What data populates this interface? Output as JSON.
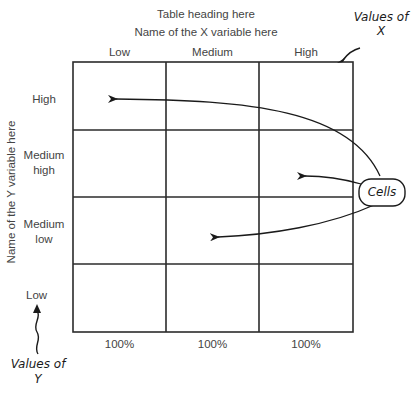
{
  "table": {
    "heading": "Table heading here",
    "x_variable_name": "Name of the X variable here",
    "y_variable_name": "Name of the Y variable here",
    "x_values": [
      "Low",
      "Medium",
      "High"
    ],
    "y_values": [
      {
        "line1": "High",
        "line2": ""
      },
      {
        "line1": "Medium",
        "line2": "high"
      },
      {
        "line1": "Medium",
        "line2": "low"
      },
      {
        "line1": "Low",
        "line2": ""
      }
    ],
    "column_totals": [
      "100%",
      "100%",
      "100%"
    ],
    "rows": 4,
    "columns": 3
  },
  "annotations": {
    "values_of_x": {
      "line1": "Values of",
      "line2": "X"
    },
    "values_of_y": {
      "line1": "Values of",
      "line2": "Y"
    },
    "cells": "Cells"
  },
  "colors": {
    "line": "#2b2b2b",
    "text": "#444444"
  }
}
